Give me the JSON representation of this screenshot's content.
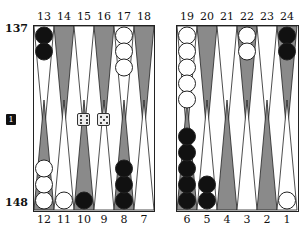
{
  "pip_counts": {
    "top": "137",
    "bottom": "148"
  },
  "cube": {
    "value": "1"
  },
  "dice": [
    6,
    5
  ],
  "top_labels": [
    "13",
    "14",
    "15",
    "16",
    "17",
    "18",
    "19",
    "20",
    "21",
    "22",
    "23",
    "24"
  ],
  "bottom_labels": [
    "12",
    "11",
    "10",
    "9",
    "8",
    "7",
    "6",
    "5",
    "4",
    "3",
    "2",
    "1"
  ],
  "colors": {
    "dark_point": "#8a8a8a",
    "light_point": "#ffffff",
    "black_checker": "#111111",
    "white_checker": "#ffffff"
  },
  "points": {
    "13": {
      "color": "black",
      "count": 2
    },
    "17": {
      "color": "white",
      "count": 3
    },
    "19": {
      "color": "white",
      "count": 5
    },
    "22": {
      "color": "white",
      "count": 2
    },
    "24": {
      "color": "black",
      "count": 2
    },
    "12": {
      "color": "white",
      "count": 3
    },
    "11": {
      "color": "white",
      "count": 1
    },
    "10": {
      "color": "black",
      "count": 1
    },
    "8": {
      "color": "black",
      "count": 3
    },
    "6": {
      "color": "black",
      "count": 5
    },
    "5": {
      "color": "black",
      "count": 2
    },
    "1": {
      "color": "white",
      "count": 1
    }
  }
}
